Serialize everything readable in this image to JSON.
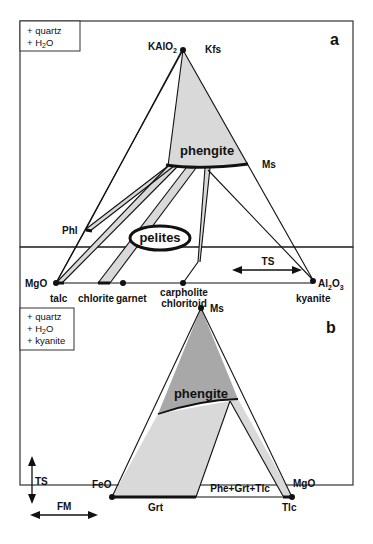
{
  "figure": {
    "panel_a": {
      "letter": "a",
      "note_lines": [
        "+ quartz",
        "+ H2O"
      ],
      "apex_formula": "KAlO2",
      "apex_label": "Kfs",
      "phengite_label": "phengite",
      "ms_label": "Ms",
      "phl_label": "Phl",
      "pelites_label": "pelites",
      "ts_label": "TS",
      "left_corner": "MgO",
      "right_corner": "Al2O3",
      "base_labels": [
        "talc",
        "chlorite",
        "garnet",
        "carpholite",
        "chloritoid",
        "kyanite"
      ]
    },
    "panel_b": {
      "letter": "b",
      "note_lines": [
        "+ quartz",
        "+ H2O",
        "+ kyanite"
      ],
      "apex_label": "Ms",
      "phengite_label": "phengite",
      "left_corner": "FeO",
      "right_corner": "MgO",
      "field_label": "Phe+Grt+Tlc",
      "grt_label": "Grt",
      "tlc_label": "Tlc",
      "ts_label": "TS",
      "fm_label": "FM"
    },
    "colors": {
      "line": "#111111",
      "light_fill": "#d9d9d9",
      "dark_fill": "#a8a8a8",
      "frame": "#333333"
    }
  }
}
